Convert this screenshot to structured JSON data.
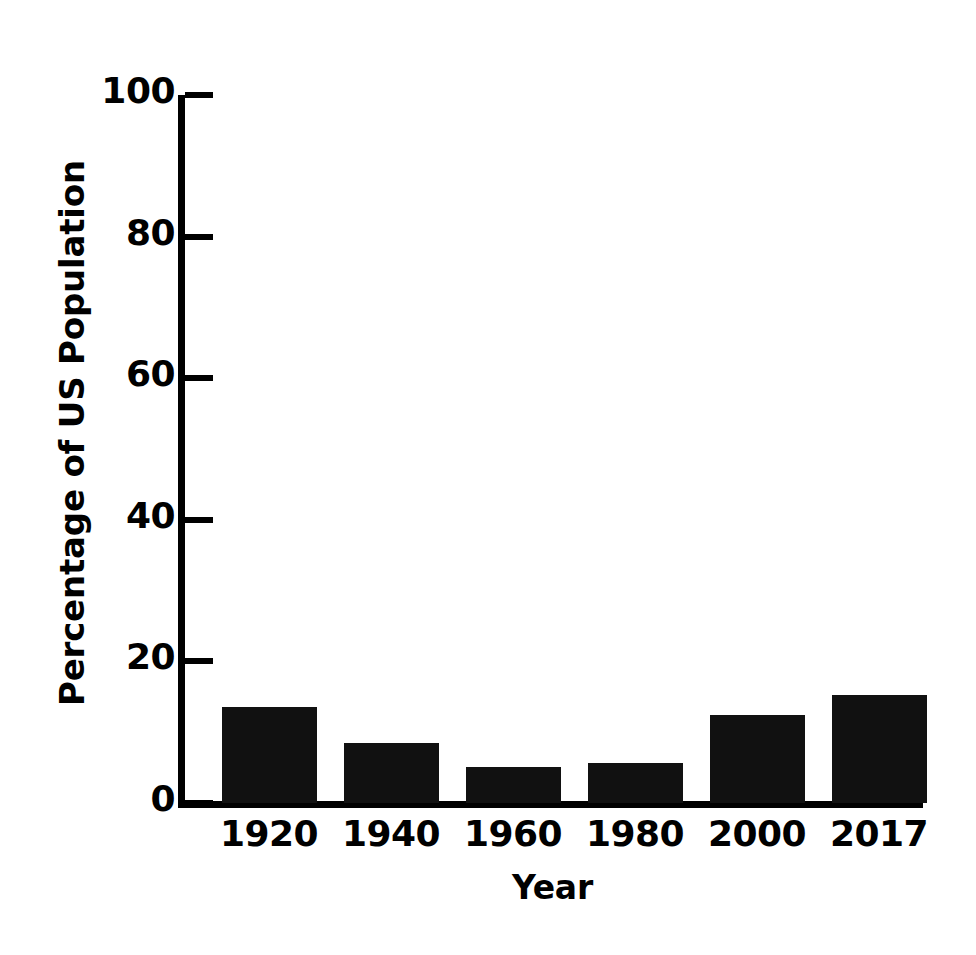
{
  "chart_data": {
    "type": "bar",
    "title": "",
    "xlabel": "Year",
    "ylabel": "Percentage of US Population",
    "categories": [
      "1920",
      "1940",
      "1960",
      "1980",
      "2000",
      "2017"
    ],
    "values": [
      13.6,
      8.5,
      5.1,
      5.6,
      12.4,
      15.3
    ],
    "ylim": [
      0,
      100
    ],
    "ytick_labels": [
      "0",
      "20",
      "40",
      "60",
      "80",
      "100"
    ],
    "ytick_values": [
      0,
      20,
      40,
      60,
      80,
      100
    ],
    "grid": false,
    "legend": null,
    "bar_color": "#111111",
    "axis_color": "#000000",
    "background_color": "#ffffff"
  }
}
